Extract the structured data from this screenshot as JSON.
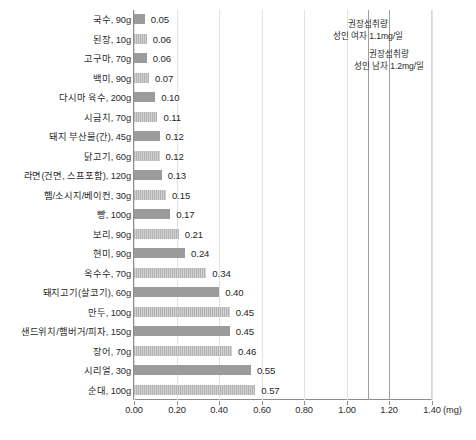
{
  "chart_data": {
    "type": "bar",
    "orientation": "horizontal",
    "title": "",
    "xlabel": "(mg)",
    "ylabel": "",
    "xlim": [
      0.0,
      1.4
    ],
    "xticks": [
      "0.00",
      "0.20",
      "0.40",
      "0.60",
      "0.80",
      "1.00",
      "1.20",
      "1.40"
    ],
    "xtick_values": [
      0.0,
      0.2,
      0.4,
      0.6,
      0.8,
      1.0,
      1.2,
      1.4
    ],
    "unit_suffix": "(mg)",
    "grid": true,
    "legend": "none",
    "categories": [
      "국수, 90g",
      "된장, 10g",
      "고구마, 70g",
      "백미, 90g",
      "다시마 육수, 200g",
      "시금치, 70g",
      "돼지 부산물(간), 45g",
      "닭고기, 60g",
      "라면(건면, 스프포함), 120g",
      "햄/소시지/베이컨, 30g",
      "빵, 100g",
      "보리, 90g",
      "현미, 90g",
      "옥수수, 70g",
      "돼지고기(살코기), 60g",
      "만두, 100g",
      "샌드위치/햄버거/피자, 150g",
      "장어, 70g",
      "시리얼, 30g",
      "순대, 100g"
    ],
    "values": [
      0.05,
      0.06,
      0.06,
      0.07,
      0.1,
      0.11,
      0.12,
      0.12,
      0.13,
      0.15,
      0.17,
      0.21,
      0.24,
      0.34,
      0.4,
      0.45,
      0.45,
      0.46,
      0.55,
      0.57
    ],
    "value_labels": [
      "0.05",
      "0.06",
      "0.06",
      "0.07",
      "0.10",
      "0.11",
      "0.12",
      "0.12",
      "0.13",
      "0.15",
      "0.17",
      "0.21",
      "0.24",
      "0.34",
      "0.40",
      "0.45",
      "0.45",
      "0.46",
      "0.55",
      "0.57"
    ],
    "annotations": [
      {
        "line1": "권장섭취량",
        "line2": "성인 여자 1.1mg/일",
        "x_value": 1.1
      },
      {
        "line1": "권장섭취량",
        "line2": "성인 남자 1.2mg/일",
        "x_value": 1.2
      }
    ],
    "reference_lines": [
      1.1,
      1.2
    ]
  },
  "colors": {
    "bar_solid": "#9b9b9b",
    "bar_striped": "#bcbcbc",
    "gridline": "#e2e2e2",
    "reference_line": "#9e9e9e",
    "axis": "#8d8d8d",
    "text": "#2b2b2b",
    "background": "#ffffff"
  }
}
